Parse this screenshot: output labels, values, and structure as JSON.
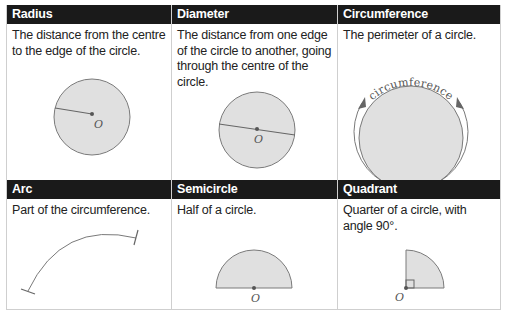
{
  "terms": [
    {
      "title": "Radius",
      "description": "The distance from the centre to the edge of the circle.",
      "label": "O"
    },
    {
      "title": "Diameter",
      "description": "The distance from one edge of the circle to another, going through the centre of the circle.",
      "label": "O"
    },
    {
      "title": "Circumference",
      "description": "The perimeter of a circle.",
      "label": "circumference"
    },
    {
      "title": "Arc",
      "description": "Part of the circumference."
    },
    {
      "title": "Semicircle",
      "description": "Half of a circle.",
      "label": "O"
    },
    {
      "title": "Quadrant",
      "description": "Quarter of a circle, with angle 90°.",
      "label": "O"
    }
  ],
  "colors": {
    "header_bg": "#1a1a1a",
    "shape_fill": "#e0e0e0",
    "stroke": "#7a7a7a",
    "dot": "#555555"
  }
}
